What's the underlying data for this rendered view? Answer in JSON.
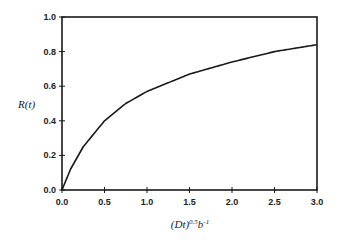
{
  "chart_data": {
    "type": "line",
    "title": "",
    "xlabel": "(Dt)^0.5 b^-1",
    "ylabel": "R(t)",
    "xlim": [
      0.0,
      3.0
    ],
    "ylim": [
      0.0,
      1.0
    ],
    "grid": false,
    "legend": null,
    "x_ticks": [
      "0.0",
      "0.5",
      "1.0",
      "1.5",
      "2.0",
      "2.5",
      "3.0"
    ],
    "y_ticks": [
      "0.0",
      "0.2",
      "0.4",
      "0.6",
      "0.8",
      "1.0"
    ],
    "series": [
      {
        "name": "R(t)",
        "x": [
          0.0,
          0.1,
          0.25,
          0.5,
          0.75,
          1.0,
          1.5,
          2.0,
          2.5,
          3.0
        ],
        "y": [
          0.0,
          0.12,
          0.25,
          0.4,
          0.5,
          0.57,
          0.67,
          0.74,
          0.8,
          0.84
        ]
      }
    ]
  },
  "labels": {
    "ylabel_text": "R(t)",
    "xlabel_main": "(Dt)",
    "xlabel_sup1": "0.5",
    "xlabel_b": "b",
    "xlabel_sup2": "-1"
  }
}
